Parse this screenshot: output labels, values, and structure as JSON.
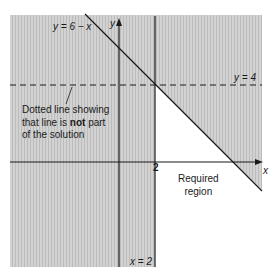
{
  "diagram": {
    "colors": {
      "shade": "#cfcfcf",
      "shade_stripe": "#bdbdbd",
      "line": "#1a1a1a",
      "background": "#ffffff"
    },
    "axes": {
      "x_label": "x",
      "y_label": "y",
      "x_tick_label": "2"
    },
    "lines": [
      {
        "id": "y-eq-6-minus-x",
        "label": "y = 6 − x",
        "style": "solid"
      },
      {
        "id": "x-eq-2",
        "label": "x = 2",
        "style": "solid"
      },
      {
        "id": "y-eq-4",
        "label": "y = 4",
        "style": "dashed"
      }
    ],
    "annotation": {
      "line1": "Dotted line showing",
      "line2_pre": "that line is ",
      "line2_bold": "not",
      "line2_post": " part",
      "line3": "of the solution"
    },
    "region_label": {
      "line1": "Required",
      "line2": "region"
    }
  }
}
